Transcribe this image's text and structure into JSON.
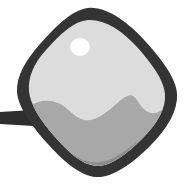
{
  "image": {
    "title": "Rounded Square Tag Icon",
    "description": "Clip-art style grayscale icon of a tilted rounded square tag with a thick dark outline, a glossy light-gray face, a white specular highlight, wavy mid-gray shading in the lower half, and a short dark cord extending off the left edge.",
    "width": 194,
    "height": 192,
    "background_color": "#ffffff",
    "style": "grayscale-clipart"
  },
  "palette": {
    "background": "#ffffff",
    "outline": "#343434",
    "cord": "#2e2e2e",
    "body_light": "#dcdcdc",
    "body_lighter": "#e6e6e6",
    "body_mid": "#a8a8a8",
    "body_dark": "#8d8d8d",
    "highlight": "#ffffff"
  },
  "parts": [
    {
      "id": "cord",
      "name": "cord",
      "label": "Cord",
      "color": "#2e2e2e",
      "geometry": "M 0 112 L 32 110 L 34 126 L 0 124 Z"
    },
    {
      "id": "outline",
      "name": "tag-outline",
      "label": "Tag outline",
      "color": "#343434",
      "geometry": "M 88 8 C 72 10 56 26 40 44 C 26 60 16 76 17 92 C 18 106 30 124 46 142 C 62 160 80 176 96 177 C 112 178 132 164 150 146 C 168 128 178 110 177 94 C 176 78 162 60 146 42 C 128 22 106 6 88 8 Z"
    },
    {
      "id": "face",
      "name": "tag-face",
      "label": "Tag face",
      "color": "#dcdcdc",
      "geometry": "M 88 20 C 74 21 60 34 46 50 C 33 64 28 78 29 91 C 30 104 40 120 54 136 C 68 152 82 165 96 166 C 110 167 126 155 142 139 C 158 123 166 108 165 94 C 164 80 152 64 138 48 C 122 30 104 19 88 20 Z"
    },
    {
      "id": "shading-mid",
      "name": "mid-gray-shading",
      "label": "Mid gray shading",
      "color": "#a8a8a8",
      "geometry": "M 29 106 C 38 101 48 99 58 103 C 68 107 74 118 84 120 C 95 122 104 114 114 106 C 122 99 128 93 133 96 C 138 99 140 108 148 112 C 155 115 161 112 165 106 L 165 100 C 164 112 158 124 142 139 C 126 155 110 167 96 166 C 82 165 68 152 54 136 C 42 122 32 110 29 106 Z"
    },
    {
      "id": "shading-dark",
      "name": "dark-gray-shading",
      "label": "Dark gray shading",
      "color": "#8d8d8d",
      "geometry": "M 64 148 C 76 158 88 164 100 162 C 114 160 128 150 138 140 C 130 152 116 162 104 165 C 92 168 76 160 64 148 Z"
    },
    {
      "id": "highlight",
      "name": "specular-highlight",
      "label": "Highlight",
      "color": "#ffffff",
      "cx": 80,
      "cy": 47,
      "rx": 10,
      "ry": 9
    }
  ]
}
